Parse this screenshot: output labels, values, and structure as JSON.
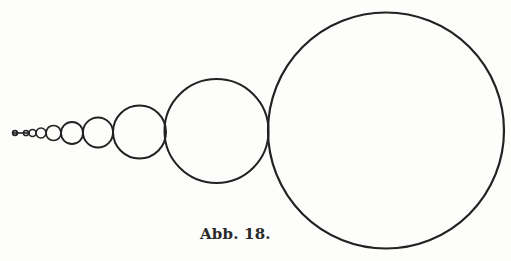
{
  "figure": {
    "caption": "Abb. 18.",
    "stroke_color": "#222222",
    "background_color": "#fdfdfb",
    "circle_count": 10
  }
}
